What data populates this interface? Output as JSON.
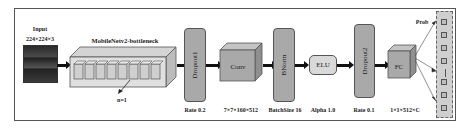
{
  "input": {
    "title": "Input",
    "size": "224×224×3"
  },
  "bottleneck": {
    "title": "MobileNetv2-bottleneck",
    "repeat_label": "n=1",
    "cube_count": 8
  },
  "dropout1": {
    "label": "Dropout1",
    "param": "Rate 0.2"
  },
  "conv": {
    "label": "Conv",
    "param": "7×7×160×512"
  },
  "bnorm": {
    "label": "BNorm",
    "param": "BatchSize 16"
  },
  "elu": {
    "label": "ELU",
    "param": "Alpha 1.0"
  },
  "dropout2": {
    "label": "Dropout2",
    "param": "Rate 0.1"
  },
  "fc": {
    "label": "FC",
    "param": "1×1×512×C"
  },
  "output": {
    "label": "Prob",
    "ellipsis": "—"
  },
  "colors": {
    "box_fill": "#a9a9a9",
    "border": "#555555",
    "elu_fill": "#d9d9d9",
    "arrow": "#111111"
  }
}
